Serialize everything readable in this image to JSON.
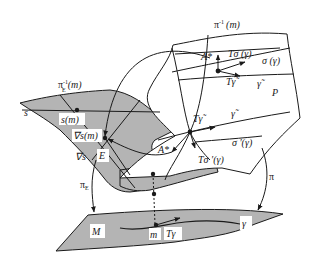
{
  "diagram": {
    "type": "fiber-bundle-connection",
    "colors": {
      "surface_fill": "#b4b4b4",
      "line": "#1a1a1a",
      "background": "#ffffff"
    },
    "labels": {
      "pi_inverse_m": "π",
      "pi_inverse_m_sup": "-1",
      "pi_inverse_m_arg": "(m)",
      "A_star_top": "A*",
      "T_sigma_gamma": "Tσ (γ)",
      "sigma_gamma": "σ (γ)",
      "T_gamma_tilde_top": "Tγ̃",
      "gamma_tilde_top": "γ̃",
      "P": "P",
      "piE_inverse_m": "π",
      "piE_inverse_m_sub": "E",
      "piE_inverse_m_sup": "-1",
      "piE_inverse_m_arg": "(m)",
      "s": "s",
      "s_m": "s(m)",
      "nabla_s_m": "∇s(m)",
      "nabla_s": "∇s",
      "E": "E",
      "T_gamma_tilde_mid": "Tγ̃",
      "gamma_tilde_mid": "γ̃",
      "A_star_mid": "A*",
      "T_sigma_prime_gamma": "Tσ ′(γ)",
      "sigma_prime_gamma": "σ ′(γ)",
      "pi_E": "π",
      "pi_E_sub": "E",
      "pi": "π",
      "M": "M",
      "m": "m",
      "T_gamma": "Tγ",
      "gamma": "γ"
    }
  }
}
